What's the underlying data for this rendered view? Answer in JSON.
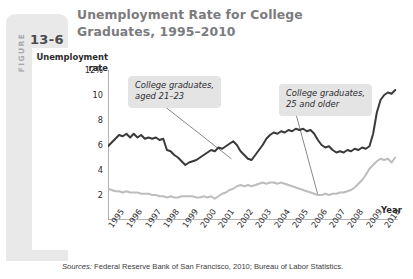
{
  "figure": {
    "word": "FIGURE",
    "number": "13-6"
  },
  "title": "Unemployment Rate for College Graduates, 1995–2010",
  "axes": {
    "y_title": "Unemployment\nrate",
    "x_title": "Year"
  },
  "annotations": {
    "young": "College graduates,\naged 21–23",
    "older": "College graduates,\n25 and older"
  },
  "source": {
    "label": "Sources:",
    "text": " Federal Reserve Bank of San Francisco, 2010; Bureau of Labor Statistics."
  },
  "colors": {
    "series_young": "#3a3a3c",
    "series_older": "#bdbdbd",
    "badge": "#e9e9ea",
    "title": "#7b7b7e",
    "annotation_bg": "#e4e4e5",
    "axis": "#6e6e70"
  },
  "chart_data": {
    "type": "line",
    "title": "Unemployment Rate for College Graduates, 1995–2010",
    "xlabel": "Year",
    "ylabel": "Unemployment rate",
    "ylim": [
      0,
      12
    ],
    "xlim": [
      1995,
      2010.75
    ],
    "grid": false,
    "legend": "annotations-inline",
    "ytick_labels": [
      "12%",
      "10",
      "8",
      "6",
      "4",
      "2"
    ],
    "ytick_values": [
      12,
      10,
      8,
      6,
      4,
      2
    ],
    "categories": [
      "1995",
      "1996",
      "1997",
      "1998",
      "1999",
      "2000",
      "2001",
      "2002",
      "2003",
      "2004",
      "2005",
      "2006",
      "2007",
      "2008",
      "2009",
      "2010"
    ],
    "series": [
      {
        "name": "College graduates, aged 21–23",
        "color": "#3a3a3c",
        "x": [
          1995.0,
          1995.2,
          1995.4,
          1995.6,
          1995.8,
          1996.0,
          1996.2,
          1996.4,
          1996.6,
          1996.8,
          1997.0,
          1997.2,
          1997.4,
          1997.6,
          1997.8,
          1998.0,
          1998.2,
          1998.4,
          1998.6,
          1998.8,
          1999.0,
          1999.2,
          1999.4,
          1999.6,
          1999.8,
          2000.0,
          2000.2,
          2000.4,
          2000.6,
          2000.8,
          2001.0,
          2001.2,
          2001.4,
          2001.6,
          2001.8,
          2002.0,
          2002.2,
          2002.4,
          2002.6,
          2002.8,
          2003.0,
          2003.2,
          2003.4,
          2003.6,
          2003.8,
          2004.0,
          2004.2,
          2004.4,
          2004.6,
          2004.8,
          2005.0,
          2005.2,
          2005.4,
          2005.6,
          2005.8,
          2006.0,
          2006.2,
          2006.4,
          2006.6,
          2006.8,
          2007.0,
          2007.2,
          2007.4,
          2007.6,
          2007.8,
          2008.0,
          2008.2,
          2008.4,
          2008.6,
          2008.8,
          2009.0,
          2009.2,
          2009.4,
          2009.6,
          2009.8,
          2010.0,
          2010.2,
          2010.4,
          2010.6
        ],
        "values": [
          5.9,
          6.2,
          6.5,
          6.8,
          6.7,
          6.9,
          6.6,
          6.9,
          6.6,
          6.8,
          6.5,
          6.6,
          6.5,
          6.6,
          6.4,
          6.5,
          5.6,
          5.5,
          5.2,
          5.0,
          4.7,
          4.4,
          4.6,
          4.7,
          4.8,
          5.0,
          5.2,
          5.4,
          5.6,
          5.5,
          5.8,
          5.7,
          5.9,
          6.1,
          6.3,
          6.0,
          5.5,
          5.2,
          4.9,
          4.8,
          5.2,
          5.6,
          6.0,
          6.5,
          6.8,
          7.0,
          6.9,
          7.1,
          7.0,
          7.2,
          7.1,
          7.3,
          7.2,
          7.3,
          7.1,
          7.2,
          6.9,
          6.4,
          6.0,
          5.8,
          5.9,
          5.6,
          5.4,
          5.5,
          5.4,
          5.6,
          5.5,
          5.7,
          5.6,
          5.8,
          5.7,
          5.9,
          6.9,
          8.6,
          9.6,
          10.0,
          10.2,
          10.1,
          10.4
        ],
        "end_value": 10.4
      },
      {
        "name": "College graduates, 25 and older",
        "color": "#bdbdbd",
        "x": [
          1995.0,
          1995.2,
          1995.4,
          1995.6,
          1995.8,
          1996.0,
          1996.2,
          1996.4,
          1996.6,
          1996.8,
          1997.0,
          1997.2,
          1997.4,
          1997.6,
          1997.8,
          1998.0,
          1998.2,
          1998.4,
          1998.6,
          1998.8,
          1999.0,
          1999.2,
          1999.4,
          1999.6,
          1999.8,
          2000.0,
          2000.2,
          2000.4,
          2000.6,
          2000.8,
          2001.0,
          2001.2,
          2001.4,
          2001.6,
          2001.8,
          2002.0,
          2002.2,
          2002.4,
          2002.6,
          2002.8,
          2003.0,
          2003.2,
          2003.4,
          2003.6,
          2003.8,
          2004.0,
          2004.2,
          2004.4,
          2004.6,
          2004.8,
          2005.0,
          2005.2,
          2005.4,
          2005.6,
          2005.8,
          2006.0,
          2006.2,
          2006.4,
          2006.6,
          2006.8,
          2007.0,
          2007.2,
          2007.4,
          2007.6,
          2007.8,
          2008.0,
          2008.2,
          2008.4,
          2008.6,
          2008.8,
          2009.0,
          2009.2,
          2009.4,
          2009.6,
          2009.8,
          2010.0,
          2010.2,
          2010.4,
          2010.6
        ],
        "values": [
          2.5,
          2.4,
          2.3,
          2.3,
          2.2,
          2.3,
          2.2,
          2.2,
          2.2,
          2.1,
          2.1,
          2.1,
          2.0,
          2.0,
          1.9,
          1.9,
          1.8,
          1.9,
          1.8,
          1.8,
          1.9,
          1.9,
          1.9,
          1.9,
          1.8,
          1.8,
          1.9,
          1.8,
          1.9,
          1.7,
          1.9,
          2.1,
          2.2,
          2.4,
          2.5,
          2.7,
          2.8,
          2.7,
          2.8,
          2.7,
          2.8,
          2.9,
          3.0,
          2.9,
          3.0,
          3.0,
          2.9,
          3.0,
          2.9,
          2.8,
          2.7,
          2.6,
          2.5,
          2.4,
          2.3,
          2.2,
          2.1,
          2.0,
          2.0,
          2.1,
          2.0,
          2.1,
          2.1,
          2.2,
          2.2,
          2.3,
          2.4,
          2.6,
          2.9,
          3.2,
          3.6,
          4.1,
          4.4,
          4.7,
          4.9,
          4.8,
          4.9,
          4.6,
          5.0
        ],
        "end_value": 5.0
      }
    ],
    "leader_lines": [
      {
        "from_annotation": "young",
        "to_x": 2001.7,
        "to_y": 4.9
      },
      {
        "from_annotation": "older",
        "to_x": 2006.4,
        "to_y": 2.0
      }
    ]
  }
}
